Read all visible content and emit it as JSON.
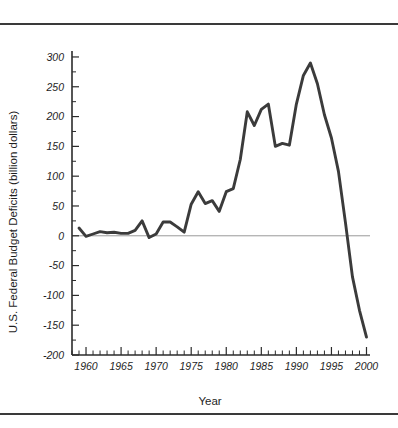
{
  "figure": {
    "background_color": "#ffffff",
    "line_color": "#3b3b3b",
    "axis_color": "#2b2b2b",
    "rule_color": "#3a3a3a",
    "zero_line_color": "#8d8d8d"
  },
  "chart_data": {
    "type": "line",
    "title": "",
    "subtitle": "",
    "xlabel": "Year",
    "ylabel": "U.S. Federal Budget Deficits (billion dollars)",
    "xlim": [
      1958,
      2000.5
    ],
    "ylim": [
      -200,
      310
    ],
    "grid": false,
    "legend": "none",
    "x_major_ticks": [
      1960,
      1965,
      1970,
      1975,
      1980,
      1985,
      1990,
      1995,
      2000
    ],
    "x_major_tick_labels": [
      "1960",
      "1965",
      "1970",
      "1975",
      "1980",
      "1985",
      "1990",
      "1995",
      "2000"
    ],
    "x_minor_tick_step": 1,
    "y_major_ticks": [
      -200,
      -150,
      -100,
      -50,
      0,
      50,
      100,
      150,
      200,
      250,
      300
    ],
    "y_major_tick_labels": [
      "-200",
      "-150",
      "-100",
      "-50",
      "0",
      "50",
      "100",
      "150",
      "200",
      "250",
      "300"
    ],
    "y_minor_tick_step": 25,
    "zero_reference_line": 0,
    "x": [
      1959,
      1960,
      1961,
      1962,
      1963,
      1964,
      1965,
      1966,
      1967,
      1968,
      1969,
      1970,
      1971,
      1972,
      1973,
      1974,
      1975,
      1976,
      1977,
      1978,
      1979,
      1980,
      1981,
      1982,
      1983,
      1984,
      1985,
      1986,
      1987,
      1988,
      1989,
      1990,
      1991,
      1992,
      1993,
      1994,
      1995,
      1996,
      1997,
      1998,
      1999,
      2000
    ],
    "values": [
      13,
      -1,
      3,
      7,
      5,
      6,
      4,
      4,
      9,
      25,
      -3,
      3,
      23,
      23,
      15,
      6,
      53,
      74,
      54,
      59,
      41,
      74,
      79,
      128,
      208,
      185,
      212,
      221,
      150,
      155,
      152,
      221,
      269,
      290,
      255,
      203,
      164,
      108,
      22,
      -69,
      -125,
      -170
    ],
    "series": [
      {
        "name": "U.S. Federal Budget Deficits",
        "values": [
          13,
          -1,
          3,
          7,
          5,
          6,
          4,
          4,
          9,
          25,
          -3,
          3,
          23,
          23,
          15,
          6,
          53,
          74,
          54,
          59,
          41,
          74,
          79,
          128,
          208,
          185,
          212,
          221,
          150,
          155,
          152,
          221,
          269,
          290,
          255,
          203,
          164,
          108,
          22,
          -69,
          -125,
          -170
        ]
      }
    ],
    "annotations": [
      {
        "label": "peak deficit",
        "x": 1992,
        "y": 290
      },
      {
        "label": "surplus at end of series",
        "x": 2000,
        "y": -170
      }
    ]
  }
}
